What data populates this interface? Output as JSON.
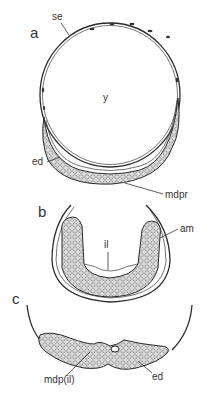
{
  "figure": {
    "panels": [
      {
        "id": "a",
        "label": "a",
        "annotations": [
          {
            "key": "se",
            "text": "se"
          },
          {
            "key": "y",
            "text": "y"
          },
          {
            "key": "ed",
            "text": "ed"
          },
          {
            "key": "mdpr",
            "text": "mdpr"
          }
        ]
      },
      {
        "id": "b",
        "label": "b",
        "annotations": [
          {
            "key": "am",
            "text": "am"
          },
          {
            "key": "il",
            "text": "il"
          }
        ]
      },
      {
        "id": "c",
        "label": "c",
        "annotations": [
          {
            "key": "mdp_il",
            "text": "mdp(il)"
          },
          {
            "key": "ed",
            "text": "ed"
          }
        ]
      }
    ]
  }
}
